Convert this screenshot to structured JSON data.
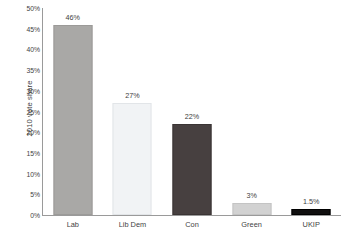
{
  "chart_data": {
    "type": "bar",
    "title": "",
    "xlabel": "",
    "ylabel": "2010 vote share",
    "categories": [
      "Lab",
      "Lib Dem",
      "Con",
      "Green",
      "UKIP"
    ],
    "values": [
      46,
      27,
      22,
      3,
      1.5
    ],
    "data_labels": [
      "46%",
      "27%",
      "22%",
      "3%",
      "1.5%"
    ],
    "bar_colors": [
      "#a9a8a6",
      "#f1f3f5",
      "#474040",
      "#d2d2d2",
      "#100f0f"
    ],
    "bar_borders": [
      "#9b9a98",
      "#e2e5e8",
      "#3a3434",
      "#c4c4c4",
      "#000000"
    ],
    "ylim": [
      0,
      50
    ],
    "ytick_values": [
      0,
      5,
      10,
      15,
      20,
      25,
      30,
      35,
      40,
      45,
      50
    ],
    "ytick_labels": [
      "0%",
      "5%",
      "10%",
      "15%",
      "20%",
      "25%",
      "30%",
      "35%",
      "40%",
      "45%",
      "50%"
    ],
    "grid": false,
    "legend": "none",
    "axis_color": "#9a9a9a"
  }
}
